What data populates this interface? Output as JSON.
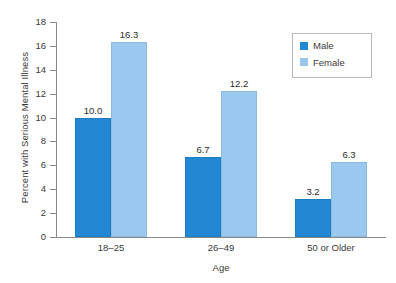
{
  "chart_data": {
    "type": "bar",
    "title": "",
    "xlabel": "Age",
    "ylabel": "Percent with Serious Mental Illness",
    "categories": [
      "18–25",
      "26–49",
      "50 or Older"
    ],
    "series": [
      {
        "name": "Male",
        "values": [
          10.0,
          6.7,
          3.2
        ],
        "labels": [
          "10.0",
          "6.7",
          "3.2"
        ],
        "color": "#2288d4"
      },
      {
        "name": "Female",
        "values": [
          16.3,
          12.2,
          6.3
        ],
        "labels": [
          "16.3",
          "12.2",
          "6.3"
        ],
        "color": "#9ac8ee"
      }
    ],
    "ylim": [
      0,
      18
    ],
    "yticks": [
      0,
      2,
      4,
      6,
      8,
      10,
      12,
      14,
      16,
      18
    ],
    "ytick_labels": [
      "0",
      "2",
      "4",
      "6",
      "8",
      "10",
      "12",
      "14",
      "16",
      "18"
    ],
    "grid": false,
    "legend_position": "top-right"
  },
  "legend": {
    "items": [
      {
        "label": "Male",
        "color": "#2288d4"
      },
      {
        "label": "Female",
        "color": "#9ac8ee"
      }
    ]
  },
  "axes": {
    "y_title": "Percent with Serious Mental Illness",
    "x_title": "Age"
  },
  "colors": {
    "male": "#2288d4",
    "female": "#9ac8ee",
    "axis": "#8a8a8a",
    "text": "#3a3a3a",
    "background": "#ffffff"
  }
}
